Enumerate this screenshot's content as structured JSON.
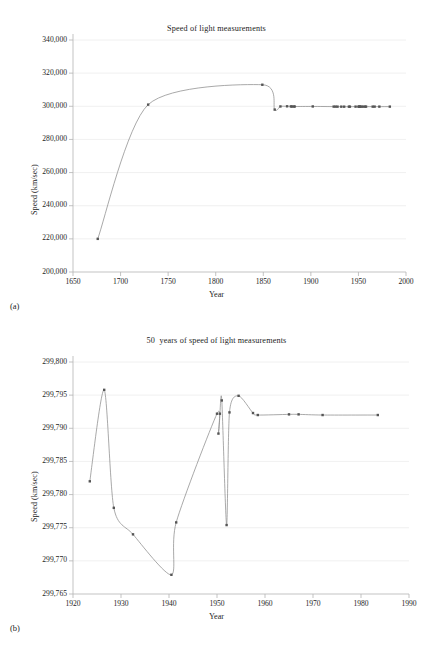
{
  "figure": {
    "panel_a_label": "(a)",
    "panel_b_label": "(b)"
  },
  "chart_data": [
    {
      "id": "a",
      "type": "line",
      "title": "Speed of light measurements",
      "xlabel": "Year",
      "ylabel": "Speed (km/sec)",
      "xlim": [
        1650,
        2000
      ],
      "ylim": [
        200000,
        340000
      ],
      "xticks": [
        1650,
        1700,
        1750,
        1800,
        1850,
        1900,
        1950,
        2000
      ],
      "xticklabels": [
        "1650",
        "1700",
        "1750",
        "1800",
        "1850",
        "1900",
        "1950",
        "2000"
      ],
      "yticks": [
        200000,
        220000,
        240000,
        260000,
        280000,
        300000,
        320000,
        340000
      ],
      "yticklabels": [
        "200,000",
        "220,000",
        "240,000",
        "260,000",
        "280,000",
        "300,000",
        "320,000",
        "340,000"
      ],
      "grid": "horizontal",
      "legend": "none",
      "marker": "square",
      "line_color": "#8c8c8c",
      "marker_color": "#555555",
      "points": [
        {
          "x": 1676,
          "y": 220000
        },
        {
          "x": 1729,
          "y": 301000
        },
        {
          "x": 1849,
          "y": 313000
        },
        {
          "x": 1862,
          "y": 298000
        },
        {
          "x": 1868,
          "y": 299900
        },
        {
          "x": 1875,
          "y": 299990
        },
        {
          "x": 1879,
          "y": 299910
        },
        {
          "x": 1880,
          "y": 299860
        },
        {
          "x": 1882,
          "y": 299850
        },
        {
          "x": 1883,
          "y": 299850
        },
        {
          "x": 1902,
          "y": 299901
        },
        {
          "x": 1924,
          "y": 299802
        },
        {
          "x": 1926,
          "y": 299796
        },
        {
          "x": 1928,
          "y": 299778
        },
        {
          "x": 1932,
          "y": 299774
        },
        {
          "x": 1935,
          "y": 299771
        },
        {
          "x": 1940,
          "y": 299768
        },
        {
          "x": 1941,
          "y": 299776
        },
        {
          "x": 1947,
          "y": 299792
        },
        {
          "x": 1950,
          "y": 299792
        },
        {
          "x": 1951,
          "y": 299789
        },
        {
          "x": 1951,
          "y": 299794
        },
        {
          "x": 1952,
          "y": 299776
        },
        {
          "x": 1953,
          "y": 299792
        },
        {
          "x": 1955,
          "y": 299795
        },
        {
          "x": 1957,
          "y": 299792
        },
        {
          "x": 1958,
          "y": 299792
        },
        {
          "x": 1965,
          "y": 299792
        },
        {
          "x": 1967,
          "y": 299792
        },
        {
          "x": 1972,
          "y": 299792
        },
        {
          "x": 1983,
          "y": 299792
        }
      ]
    },
    {
      "id": "b",
      "type": "line",
      "title": "50  years of speed of light measurements",
      "xlabel": "Year",
      "ylabel": "Speed (km/sec)",
      "xlim": [
        1920,
        1990
      ],
      "ylim": [
        299765,
        299800
      ],
      "xticks": [
        1920,
        1930,
        1940,
        1950,
        1960,
        1970,
        1980,
        1990
      ],
      "xticklabels": [
        "1920",
        "1930",
        "1940",
        "1950",
        "1960",
        "1970",
        "1980",
        "1990"
      ],
      "yticks": [
        299765,
        299770,
        299775,
        299780,
        299785,
        299790,
        299795,
        299800
      ],
      "yticklabels": [
        "299,765",
        "299,770",
        "299,775",
        "299,780",
        "299,785",
        "299,790",
        "299,795",
        "299,800"
      ],
      "grid": "horizontal",
      "legend": "none",
      "marker": "square",
      "line_color": "#8c8c8c",
      "marker_color": "#555555",
      "points": [
        {
          "x": 1923.5,
          "y": 299782.0
        },
        {
          "x": 1926.5,
          "y": 299795.8
        },
        {
          "x": 1928.5,
          "y": 299778.0
        },
        {
          "x": 1932.5,
          "y": 299774.0
        },
        {
          "x": 1940.5,
          "y": 299767.9
        },
        {
          "x": 1941.5,
          "y": 299775.8
        },
        {
          "x": 1950.0,
          "y": 299792.2
        },
        {
          "x": 1950.3,
          "y": 299789.2
        },
        {
          "x": 1950.6,
          "y": 299792.2
        },
        {
          "x": 1951.0,
          "y": 299794.2
        },
        {
          "x": 1952.0,
          "y": 299775.4
        },
        {
          "x": 1952.6,
          "y": 299792.4
        },
        {
          "x": 1954.5,
          "y": 299794.9
        },
        {
          "x": 1957.5,
          "y": 299792.3
        },
        {
          "x": 1958.5,
          "y": 299792.0
        },
        {
          "x": 1965.0,
          "y": 299792.1
        },
        {
          "x": 1967.0,
          "y": 299792.1
        },
        {
          "x": 1972.0,
          "y": 299792.0
        },
        {
          "x": 1983.5,
          "y": 299792.0
        }
      ]
    }
  ]
}
